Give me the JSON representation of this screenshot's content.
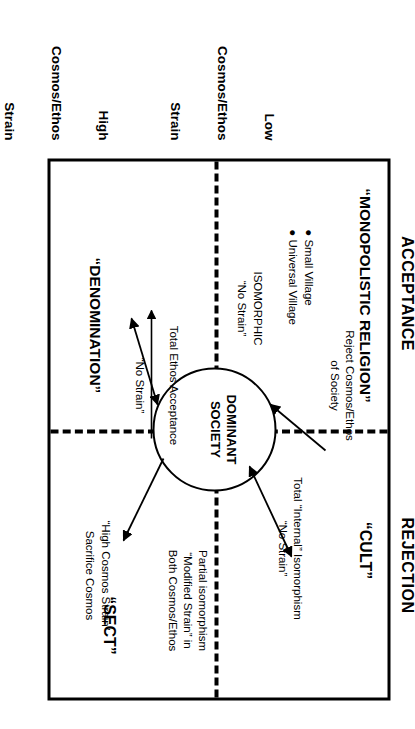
{
  "diagram": {
    "title_note": "Church-sect typology matrix",
    "axis_top": {
      "acceptance": "ACCEPTANCE",
      "rejection": "REJECTION"
    },
    "axis_side": {
      "low": "Low\nCosmos/Ethos\nStrain",
      "low_line1": "Low",
      "low_line2": "Cosmos/Ethos",
      "low_line3": "Strain",
      "high": "High\nCosmos/Ethos\nStrain",
      "high_line1": "High",
      "high_line2": "Cosmos/Ethos",
      "high_line3": "Strain"
    },
    "center": {
      "line1": "DOMINANT",
      "line2": "SOCIETY"
    },
    "quadrants": [
      {
        "id": "monopolistic-religion",
        "label": "“MONOPOLISTIC RELIGION”",
        "bullets": [
          "Small Village",
          "Universal Village"
        ],
        "annotation": {
          "line1": "ISOMORPHIC",
          "line2": "“No Strain”"
        }
      },
      {
        "id": "cult",
        "label": "“CULT”",
        "annotation_left": {
          "line1": "Reject Cosmos/Ethos",
          "line2": "of Society"
        },
        "annotation_right": {
          "line1": "Total “Internal” Isomorphism",
          "line2": "“No Strain”"
        }
      },
      {
        "id": "denomination",
        "label": "“DENOMINATION”",
        "annotation_left": {
          "line1": "Total Ethos Acceptance",
          "line2": "“No Strain”"
        },
        "annotation_right": {
          "line1": "“High Cosmos Strain”",
          "line2": "Sacrifice Cosmos"
        }
      },
      {
        "id": "sect",
        "label": "“SECT”",
        "annotation": {
          "line1": "Partial isomorphism",
          "line2": "“Modified Strain” in",
          "line3": "Both Cosmos/Ethos"
        }
      }
    ],
    "colors": {
      "ink": "#000000",
      "paper": "#ffffff"
    }
  }
}
